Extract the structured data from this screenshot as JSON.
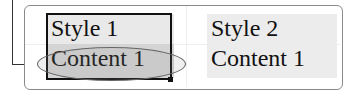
{
  "table": {
    "columns": [
      {
        "header": "Style 1",
        "content": "Content 1"
      },
      {
        "header": "Style 2",
        "content": "Content 1"
      }
    ]
  },
  "selection": {
    "selected_cell": "Content 1",
    "column": 1
  }
}
